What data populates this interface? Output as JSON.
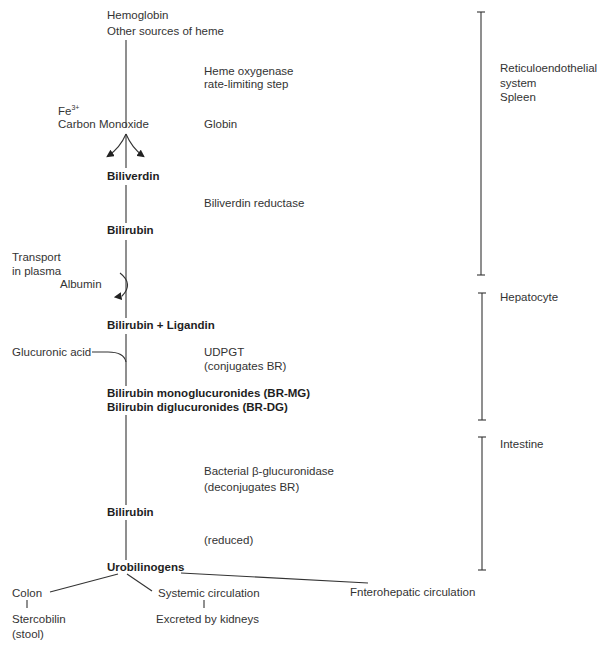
{
  "diagram": {
    "pathway": {
      "source": [
        "Hemoglobin",
        "Other sources of heme"
      ],
      "heme_oxygenase": [
        "Heme oxygenase",
        "rate-limiting step"
      ],
      "byproducts": {
        "iron": "Fe",
        "iron_superscript": "3+",
        "co": "Carbon Monoxide"
      },
      "globin": "Globin",
      "biliverdin": "Biliverdin",
      "biliverdin_reductase": "Biliverdin reductase",
      "bilirubin_1": "Bilirubin",
      "transport": [
        "Transport",
        "in plasma"
      ],
      "albumin": "Albumin",
      "bilirubin_ligandin": "Bilirubin + Ligandin",
      "glucuronic_acid": "Glucuronic acid",
      "udpgt": [
        "UDPGT",
        "(conjugates BR)"
      ],
      "conjugates": [
        "Bilirubin monoglucuronides (BR-MG)",
        "Bilirubin diglucuronides (BR-DG)"
      ],
      "bacterial": [
        "Bacterial β-glucuronidase",
        "(deconjugates BR)"
      ],
      "bilirubin_2": "Bilirubin",
      "reduced": "(reduced)",
      "urobilinogens": "Urobilinogens",
      "fates": {
        "colon": "Colon",
        "stercobilin": [
          "Stercobilin",
          "(stool)"
        ],
        "systemic": "Systemic circulation",
        "kidneys": "Excreted by kidneys",
        "enterohepatic": "Fnterohepatic circulation"
      }
    },
    "locations": [
      {
        "lines": [
          "Reticuloendothelial",
          "system",
          "Spleen"
        ]
      },
      {
        "lines": [
          "Hepatocyte"
        ]
      },
      {
        "lines": [
          "Intestine"
        ]
      }
    ]
  }
}
